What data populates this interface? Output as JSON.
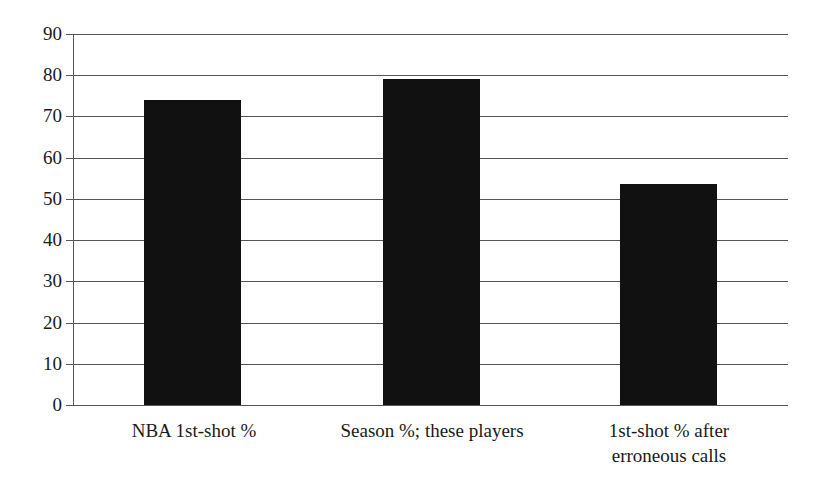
{
  "chart_data": {
    "type": "bar",
    "title": "",
    "subtitle": "",
    "xlabel": "",
    "ylabel": "",
    "categories": [
      "NBA 1st-shot %",
      "Season %; these players",
      "1st-shot % after\nerroneous calls"
    ],
    "values": [
      74,
      79,
      53.5
    ],
    "ylim": [
      0,
      90
    ],
    "ytick_labels": [
      "0",
      "10",
      "20",
      "30",
      "40",
      "50",
      "60",
      "70",
      "80",
      "90"
    ],
    "ytick_values": [
      0,
      10,
      20,
      30,
      40,
      50,
      60,
      70,
      80,
      90
    ],
    "grid": "horizontal",
    "legend": "none",
    "bar_color": "#111111",
    "gridline_color": "#555555",
    "background_color": "#ffffff",
    "text_color": "#1a1a1a",
    "annotations": []
  },
  "axis": {
    "y_ticks": [
      {
        "label": "90",
        "value": 90
      },
      {
        "label": "80",
        "value": 80
      },
      {
        "label": "70",
        "value": 70
      },
      {
        "label": "60",
        "value": 60
      },
      {
        "label": "50",
        "value": 50
      },
      {
        "label": "40",
        "value": 40
      },
      {
        "label": "30",
        "value": 30
      },
      {
        "label": "20",
        "value": 20
      },
      {
        "label": "10",
        "value": 10
      },
      {
        "label": "0",
        "value": 0
      }
    ]
  },
  "bars": [
    {
      "label": "NBA 1st-shot %",
      "value": 74
    },
    {
      "label": "Season %; these players",
      "value": 79
    },
    {
      "label": "1st-shot % after\nerroneous calls",
      "value": 53.5
    }
  ]
}
